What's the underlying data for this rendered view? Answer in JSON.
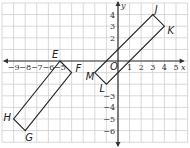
{
  "figure": {
    "axis_x_label": "x",
    "axis_y_label": "y",
    "origin_label": "O",
    "x_ticks": [
      "-9",
      "-8",
      "-7",
      "-6",
      "-5",
      "1",
      "2",
      "3",
      "4",
      "5"
    ],
    "y_ticks": [
      "4",
      "3",
      "2",
      "-3",
      "-4",
      "-5",
      "-6"
    ],
    "x_range": [
      -10,
      6
    ],
    "y_range": [
      -7,
      5
    ],
    "grid_color": "#c8c8c8",
    "line_color": "#222222"
  },
  "shapes": [
    {
      "name": "rectangle-JK",
      "vertices": [
        {
          "label": "J",
          "x": 3,
          "y": 4
        },
        {
          "label": "K",
          "x": 4,
          "y": 3
        },
        {
          "label": "",
          "x": -1,
          "y": -2
        },
        {
          "label": "",
          "x": -2,
          "y": -1
        }
      ]
    },
    {
      "name": "rectangle-EF",
      "vertices": [
        {
          "label": "E",
          "x": -5,
          "y": 0
        },
        {
          "label": "F",
          "x": -4,
          "y": -1
        },
        {
          "label": "G",
          "x": -8,
          "y": -6
        },
        {
          "label": "H",
          "x": -9,
          "y": -5
        }
      ]
    },
    {
      "name": "labels-ML",
      "vertices": [
        {
          "label": "M",
          "x": -2,
          "y": -1
        },
        {
          "label": "L",
          "x": -1,
          "y": -2
        }
      ]
    }
  ],
  "labels": {
    "J": "J",
    "K": "K",
    "E": "E",
    "F": "F",
    "G": "G",
    "H": "H",
    "M": "M",
    "L": "L"
  }
}
